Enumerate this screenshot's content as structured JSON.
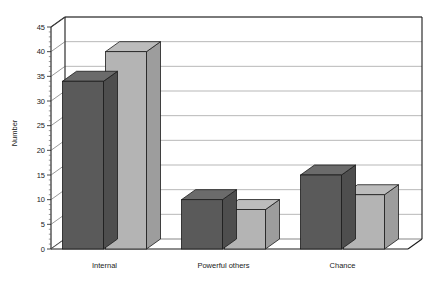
{
  "chart_data": {
    "type": "bar",
    "title": "",
    "subtitle": "",
    "xlabel": "",
    "ylabel": "Number",
    "categories": [
      "Internal",
      "Powerful others",
      "Chance"
    ],
    "series": [
      {
        "name": "Series 1",
        "color": "#5a5a5a",
        "values": [
          34,
          10,
          15
        ]
      },
      {
        "name": "Series 2",
        "color": "#b4b4b4",
        "values": [
          40,
          8,
          11
        ]
      }
    ],
    "ylim": [
      0,
      45
    ],
    "yticks": [
      0,
      5,
      10,
      15,
      20,
      25,
      30,
      35,
      40,
      45
    ],
    "ytick_labels": [
      "0",
      "5",
      "10",
      "15",
      "20",
      "25",
      "30",
      "35",
      "40",
      "45"
    ],
    "grid": true,
    "grid_axis": "y",
    "legend": false,
    "legend_position": "none",
    "style": "3d-grouped-bars",
    "background_color": "#ffffff",
    "axis_color": "#1a1a1a",
    "gridline_color": "#9a9a9a"
  }
}
